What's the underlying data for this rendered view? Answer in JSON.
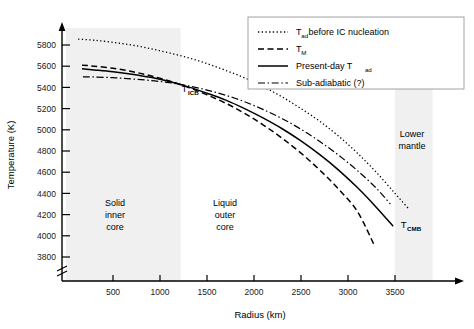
{
  "chart_data": {
    "type": "line",
    "title": "",
    "xlabel": "Radius (km)",
    "ylabel": "Temperature (K)",
    "xlim": [
      0,
      3900
    ],
    "ylim": [
      3700,
      5900
    ],
    "xticks": [
      500,
      1000,
      1500,
      2000,
      2500,
      3000,
      3500
    ],
    "yticks": [
      3800,
      4000,
      4200,
      4400,
      4600,
      4800,
      5000,
      5200,
      5400,
      5600,
      5800
    ],
    "grid": false,
    "y_axis_break": true,
    "legend_position": "top-right",
    "series": [
      {
        "name": "T_ad before IC nucleation",
        "legend_label": "T",
        "legend_sub": "ad",
        "legend_rest": " before IC nucleation",
        "style": "dotted",
        "x": [
          130,
          300,
          500,
          700,
          900,
          1100,
          1300,
          1500,
          1700,
          1900,
          2100,
          2300,
          2500,
          2700,
          2900,
          3100,
          3300,
          3500,
          3650
        ],
        "y": [
          5855,
          5845,
          5825,
          5800,
          5765,
          5725,
          5680,
          5625,
          5560,
          5490,
          5405,
          5310,
          5200,
          5080,
          4940,
          4780,
          4600,
          4400,
          4250
        ]
      },
      {
        "name": "T_M",
        "legend_label": "T",
        "legend_sub": "M",
        "legend_rest": "",
        "style": "dashed",
        "x": [
          170,
          300,
          500,
          700,
          900,
          1100,
          1300,
          1500,
          1700,
          1900,
          2100,
          2300,
          2500,
          2700,
          2900,
          3100,
          3280
        ],
        "y": [
          5610,
          5600,
          5580,
          5550,
          5510,
          5460,
          5400,
          5330,
          5250,
          5155,
          5045,
          4920,
          4780,
          4620,
          4440,
          4230,
          3910
        ]
      },
      {
        "name": "Present-day T_ad",
        "legend_label": "Present-day T",
        "legend_sub": "ad",
        "legend_rest": "",
        "style": "solid",
        "x": [
          170,
          300,
          500,
          700,
          900,
          1100,
          1300,
          1500,
          1700,
          1900,
          2100,
          2300,
          2500,
          2700,
          2900,
          3100,
          3300,
          3480
        ],
        "y": [
          5575,
          5565,
          5548,
          5525,
          5495,
          5455,
          5405,
          5345,
          5280,
          5200,
          5110,
          5010,
          4895,
          4765,
          4620,
          4455,
          4270,
          4090
        ]
      },
      {
        "name": "Sub-adiabatic (?)",
        "legend_label": "Sub-adiabatic (?)",
        "legend_sub": "",
        "legend_rest": "",
        "style": "dashdot",
        "x": [
          180,
          300,
          500,
          700,
          900,
          1100,
          1300,
          1500,
          1700,
          1900,
          2100,
          2300,
          2500,
          2700,
          2900,
          3100,
          3300,
          3450
        ],
        "y": [
          5500,
          5498,
          5492,
          5480,
          5465,
          5445,
          5415,
          5375,
          5325,
          5265,
          5190,
          5105,
          5005,
          4890,
          4760,
          4615,
          4450,
          4300
        ]
      }
    ],
    "shaded_regions": [
      {
        "name": "solid-inner-core",
        "x_start": 0,
        "x_end": 1220,
        "label": [
          "Solid",
          "inner",
          "core"
        ],
        "color": "#f0f0f0"
      },
      {
        "name": "lower-mantle",
        "x_start": 3500,
        "x_end": 3900,
        "label": [
          "Lower",
          "mantle"
        ],
        "color": "#f0f0f0"
      }
    ],
    "unshaded_region": {
      "name": "liquid-outer-core",
      "label": [
        "Liquid",
        "outer",
        "core"
      ]
    },
    "annotations": [
      {
        "name": "t-icb",
        "main": "T",
        "sub": "ICB",
        "x": 1230,
        "y": 5360
      },
      {
        "name": "t-cmb",
        "main": "T",
        "sub": "CMB",
        "x": 3560,
        "y": 4075
      }
    ]
  },
  "legend": {
    "items": [
      {
        "label": "T",
        "sub": "ad",
        "rest": " before IC nucleation",
        "style": "dotted"
      },
      {
        "label": "T",
        "sub": "M",
        "rest": "",
        "style": "dashed"
      },
      {
        "label": "Present-day T",
        "sub": "ad",
        "rest": "",
        "style": "solid"
      },
      {
        "label": "Sub-adiabatic (?)",
        "sub": "",
        "rest": "",
        "style": "dashdot"
      }
    ]
  },
  "axes": {
    "x_title": "Radius (km)",
    "y_title": "Temperature (K)",
    "xtick_labels": [
      "500",
      "1000",
      "1500",
      "2000",
      "2500",
      "3000",
      "3500"
    ],
    "ytick_labels": [
      "3800",
      "4000",
      "4200",
      "4400",
      "4600",
      "4800",
      "5000",
      "5200",
      "5400",
      "5600",
      "5800"
    ]
  },
  "regions": {
    "inner_core_lines": [
      "Solid",
      "inner",
      "core"
    ],
    "outer_core_lines": [
      "Liquid",
      "outer",
      "core"
    ],
    "lower_mantle_lines": [
      "Lower",
      "mantle"
    ]
  },
  "colors": {
    "background": "#ffffff",
    "shade": "#f0f0f0",
    "ink": "#000000"
  }
}
